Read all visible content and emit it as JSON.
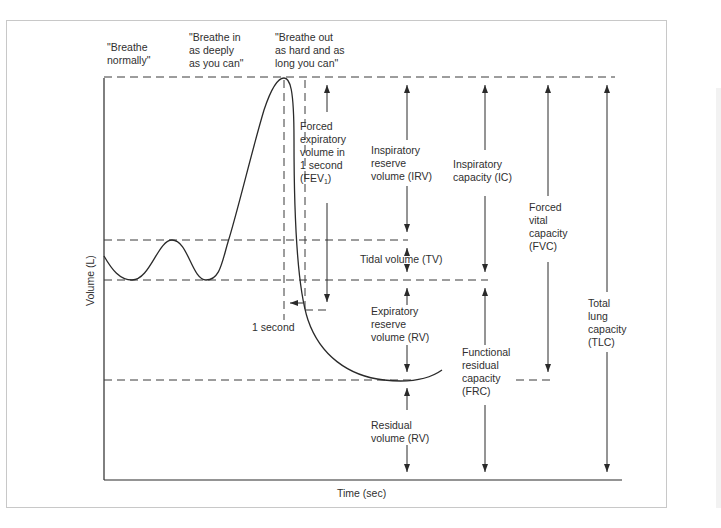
{
  "diagram": {
    "axes": {
      "y_label": "Volume (L)",
      "x_label": "Time (sec)"
    },
    "phase_instructions": [
      {
        "id": "normal",
        "text": "\"Breathe\nnormally\""
      },
      {
        "id": "inhale",
        "text": "\"Breathe in\nas deeply\nas you can\""
      },
      {
        "id": "exhale",
        "text": "\"Breathe out\nas hard and as\nlong you can\""
      }
    ],
    "volumes": {
      "fev1": {
        "line1": "Forced\nexpiratory\nvolume in\n1 second",
        "prefix": "(FEV",
        "subscript": "1",
        "suffix": ")"
      },
      "irv": "Inspiratory\nreserve\nvolume (IRV)",
      "tv": "Tidal volume (TV)",
      "erv": "Expiratory\nreserve\nvolume (RV)",
      "rv": "Residual\nvolume (RV)",
      "one_second": "1 second"
    },
    "capacities": {
      "ic": "Inspiratory\ncapacity (IC)",
      "frc": "Functional\nresidual\ncapacity\n(FRC)",
      "fvc": "Forced\nvital\ncapacity\n(FVC)",
      "tlc": "Total\nlung\ncapacity\n(TLC)"
    },
    "colors": {
      "line": "#2a2a2a",
      "frame": "#c8c8c8",
      "background": "#ffffff"
    }
  }
}
